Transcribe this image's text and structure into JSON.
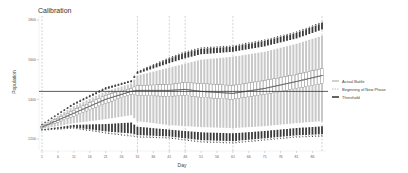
{
  "chart_data": {
    "type": "box",
    "title": "Calibration",
    "xlabel": "Day",
    "ylabel": "Population",
    "x_ticks": [
      1,
      6,
      11,
      16,
      21,
      26,
      31,
      36,
      41,
      46,
      51,
      56,
      61,
      66,
      71,
      76,
      81,
      86
    ],
    "y_ticks": [
      1200,
      1400,
      1600,
      1800
    ],
    "xlim": [
      1,
      89
    ],
    "ylim": [
      1150,
      1820
    ],
    "grid": false,
    "legend_position": "right",
    "legend": [
      {
        "label": "Actual Battle",
        "style": "solid-gray"
      },
      {
        "label": "Beginning of New Phase",
        "style": "dashed-gray"
      },
      {
        "label": "Threshold",
        "style": "solid-black"
      }
    ],
    "threshold": 1440,
    "phase_days": [
      1,
      31,
      41,
      46,
      61,
      89
    ],
    "series_anchor_points": {
      "day": [
        1,
        11,
        21,
        29,
        31,
        41,
        46,
        51,
        61,
        71,
        81,
        89
      ],
      "median": [
        1260,
        1330,
        1400,
        1440,
        1445,
        1445,
        1450,
        1440,
        1430,
        1455,
        1490,
        1520
      ],
      "q1": [
        1255,
        1315,
        1380,
        1425,
        1420,
        1415,
        1420,
        1410,
        1400,
        1425,
        1455,
        1480
      ],
      "q3": [
        1265,
        1345,
        1420,
        1455,
        1470,
        1475,
        1485,
        1480,
        1470,
        1495,
        1525,
        1555
      ],
      "inner_low": [
        1250,
        1280,
        1300,
        1320,
        1290,
        1270,
        1265,
        1260,
        1255,
        1265,
        1280,
        1290
      ],
      "inner_high": [
        1270,
        1365,
        1440,
        1480,
        1520,
        1560,
        1580,
        1600,
        1615,
        1640,
        1680,
        1720
      ],
      "min": [
        1245,
        1255,
        1230,
        1215,
        1210,
        1205,
        1195,
        1185,
        1180,
        1195,
        1210,
        1215
      ],
      "max": [
        1275,
        1380,
        1460,
        1495,
        1540,
        1610,
        1640,
        1660,
        1670,
        1700,
        1740,
        1790
      ]
    }
  }
}
